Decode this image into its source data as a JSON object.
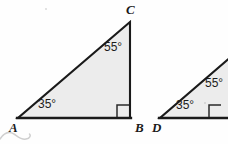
{
  "figure": {
    "background_color": "#fefefe",
    "fill_color": "#ececec",
    "stroke_color": "#1a1a1a",
    "triangles": [
      {
        "id": "triangle-abc",
        "name": "Triangle ABC",
        "vertices": [
          {
            "label": "A",
            "x": 18,
            "y": 118,
            "angle": "35°",
            "is_right_angle": false
          },
          {
            "label": "B",
            "x": 130,
            "y": 118,
            "angle": "90°",
            "is_right_angle": true
          },
          {
            "label": "C",
            "x": 130,
            "y": 22,
            "angle": "55°",
            "is_right_angle": false
          }
        ],
        "angle_labels": [
          {
            "text": "35°",
            "at_vertex": "A",
            "x": 38,
            "y": 98
          },
          {
            "text": "55°",
            "at_vertex": "C",
            "x": 104,
            "y": 41
          }
        ],
        "vertex_labels": [
          {
            "text": "A",
            "x": 9,
            "y": 122
          },
          {
            "text": "B",
            "x": 135,
            "y": 122
          },
          {
            "text": "C",
            "x": 126,
            "y": 4
          }
        ],
        "right_angle_marker": {
          "x": 118,
          "y": 106,
          "size": 12
        }
      },
      {
        "id": "triangle-def",
        "name": "Triangle DEF (cropped at right edge)",
        "cropped": true,
        "vertices": [
          {
            "label": "D",
            "x": 160,
            "y": 118,
            "angle": "35°",
            "is_right_angle": false
          },
          {
            "label": "E",
            "x": 248,
            "y": 118,
            "angle": "90°",
            "is_right_angle": true
          },
          {
            "label": "F",
            "x": 248,
            "y": 42,
            "angle": "55°",
            "is_right_angle": false
          }
        ],
        "angle_labels": [
          {
            "text": "35°",
            "at_vertex": "D",
            "x": 176,
            "y": 99
          },
          {
            "text": "55°",
            "at_vertex": "F",
            "x": 205,
            "y": 77
          }
        ],
        "vertex_labels": [
          {
            "text": "D",
            "x": 152,
            "y": 122
          }
        ],
        "right_angle_marker": {
          "x": 210,
          "y": 106,
          "size": 12
        }
      }
    ],
    "annotations": [
      {
        "id": "pencil-scribble",
        "name": "Faint handwritten pencil squiggle below vertex A",
        "color": "#c9c9c9"
      }
    ]
  }
}
